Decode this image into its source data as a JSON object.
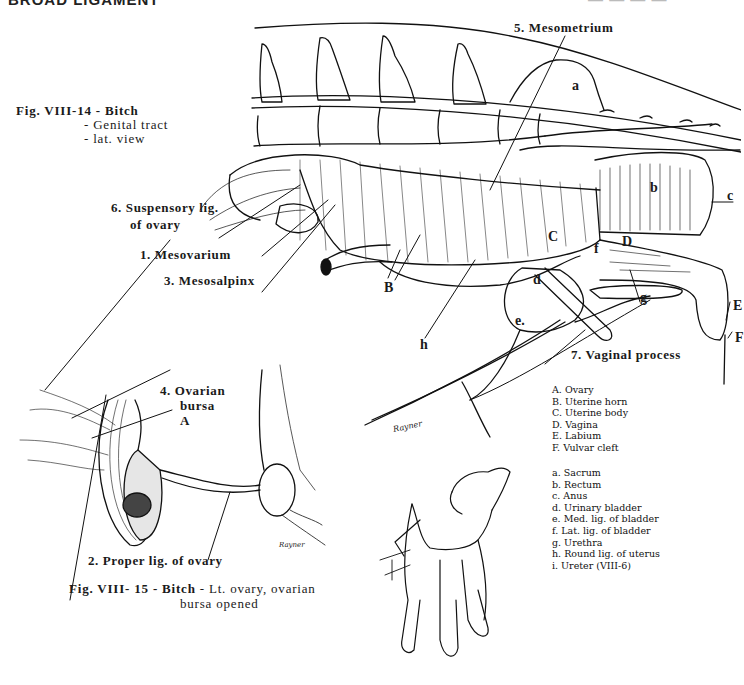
{
  "page": {
    "header_left": "BROAD LIGAMENT",
    "header_right": "— — — —"
  },
  "figure_14": {
    "caption_title": "Fig. VIII-14 - Bitch",
    "caption_line2": "- Genital tract",
    "caption_line3": "- lat. view",
    "numbered_labels": {
      "mesometrium": "5. Mesometrium",
      "suspensory_1": "6. Suspensory lig.",
      "suspensory_2": "of ovary",
      "mesovarium": "1. Mesovarium",
      "mesosalpinx": "3. Mesosalpinx",
      "vaginal_process": "7. Vaginal process"
    },
    "letter_labels": {
      "a": "a",
      "b": "b",
      "c": "c",
      "C": "C",
      "f": "f",
      "D": "D",
      "B": "B",
      "d": "d",
      "h": "h",
      "e": "e.",
      "g": "g",
      "E": "E",
      "F": "F"
    },
    "legend_upper": [
      "A. Ovary",
      "B. Uterine horn",
      "C. Uterine body",
      "D. Vagina",
      "E. Labium",
      "F. Vulvar cleft"
    ],
    "legend_lower": [
      "a. Sacrum",
      "b. Rectum",
      "c. Anus",
      "d. Urinary bladder",
      "e. Med. lig. of bladder",
      "f. Lat. lig. of bladder",
      "g. Urethra",
      "h. Round lig. of uterus",
      "i. Ureter (VIII-6)"
    ],
    "signature": "Rayner"
  },
  "figure_15": {
    "caption_bold": "Fig. VIII- 15 - Bitch",
    "caption_rest": " - Lt. ovary, ovarian",
    "caption_line2": "bursa opened",
    "labels": {
      "ovarian_1": "4. Ovarian",
      "ovarian_2": "bursa",
      "A": "A",
      "proper_lig": "2. Proper lig. of ovary"
    },
    "signature": "Rayner"
  }
}
